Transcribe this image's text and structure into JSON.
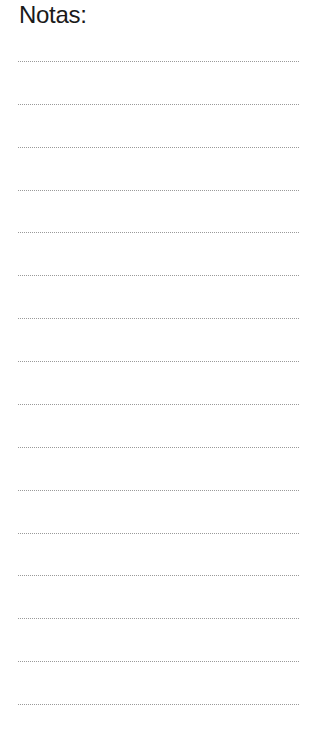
{
  "page": {
    "title": "Notas:",
    "line_count": 16,
    "first_line_y": 61,
    "line_spacing": 42.87,
    "line_color": "#9a9a9a"
  }
}
